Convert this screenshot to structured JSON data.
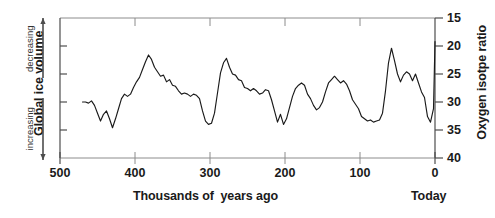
{
  "figure": {
    "left_axis": {
      "title": "Global ice volume",
      "direction_top": "decreasing",
      "direction_bottom": "increasing"
    },
    "right_axis": {
      "title": "Oxygen isotpe ratio",
      "tick_labels": [
        "15",
        "20",
        "25",
        "30",
        "35",
        "40"
      ]
    },
    "x_axis": {
      "title": "Thousands of  years ago",
      "end_label": "Today",
      "tick_labels": [
        "500",
        "400",
        "300",
        "200",
        "100",
        "0"
      ]
    },
    "colors": {
      "line": "#1a1a1a",
      "axis": "#4d4d4d",
      "text": "#1a1a1a",
      "background": "#ffffff"
    }
  },
  "chart_data": {
    "type": "line",
    "title": "",
    "subtitle": "",
    "xlabel": "Thousands of  years ago",
    "ylabel": "Oxygen isotpe ratio",
    "ylabel_left": "Global ice volume",
    "grid": false,
    "legend": null,
    "xlim": [
      500,
      0
    ],
    "ylim": [
      40,
      15
    ],
    "y_axis_inverted": true,
    "x_axis_reversed": true,
    "xticks": [
      500,
      400,
      300,
      200,
      100,
      0
    ],
    "yticks": [
      15,
      20,
      25,
      30,
      35,
      40
    ],
    "series": [
      {
        "name": "Oxygen isotope ratio",
        "x": [
          470,
          466,
          462,
          458,
          454,
          450,
          446,
          442,
          438,
          434,
          430,
          426,
          422,
          418,
          414,
          410,
          406,
          402,
          398,
          394,
          390,
          386,
          382,
          378,
          374,
          370,
          366,
          362,
          358,
          354,
          350,
          346,
          342,
          338,
          334,
          330,
          326,
          322,
          318,
          314,
          310,
          306,
          302,
          298,
          294,
          290,
          286,
          282,
          278,
          274,
          270,
          266,
          262,
          258,
          254,
          250,
          246,
          242,
          238,
          234,
          230,
          226,
          222,
          218,
          214,
          210,
          206,
          202,
          198,
          194,
          190,
          186,
          182,
          178,
          174,
          170,
          166,
          162,
          158,
          154,
          150,
          146,
          142,
          138,
          134,
          130,
          126,
          122,
          118,
          114,
          110,
          106,
          102,
          98,
          94,
          90,
          86,
          82,
          78,
          74,
          70,
          66,
          62,
          58,
          54,
          50,
          46,
          42,
          38,
          34,
          30,
          26,
          22,
          18,
          14,
          10,
          6,
          2,
          0
        ],
        "y": [
          30.0,
          30.0,
          30.2,
          29.8,
          30.6,
          32.0,
          33.4,
          32.2,
          31.6,
          33.0,
          34.6,
          33.0,
          31.2,
          29.4,
          28.6,
          29.0,
          28.6,
          27.4,
          26.4,
          25.6,
          24.2,
          22.8,
          21.6,
          22.4,
          23.8,
          24.6,
          25.4,
          25.2,
          26.4,
          26.0,
          27.0,
          27.2,
          28.0,
          28.6,
          28.4,
          28.6,
          29.0,
          28.6,
          28.8,
          29.4,
          31.6,
          33.4,
          34.0,
          33.8,
          32.0,
          28.4,
          24.8,
          23.0,
          22.2,
          23.8,
          25.0,
          25.2,
          26.0,
          26.2,
          27.4,
          27.6,
          28.0,
          27.6,
          28.0,
          28.6,
          28.4,
          27.8,
          28.0,
          29.6,
          31.6,
          33.6,
          32.2,
          34.0,
          33.0,
          31.0,
          29.0,
          27.6,
          27.0,
          26.6,
          27.0,
          28.6,
          29.4,
          30.6,
          31.4,
          31.0,
          30.0,
          28.2,
          26.6,
          26.0,
          25.4,
          26.0,
          26.6,
          26.2,
          26.8,
          28.0,
          29.6,
          30.4,
          31.2,
          32.6,
          33.0,
          33.4,
          33.2,
          33.6,
          33.4,
          33.2,
          32.0,
          28.0,
          23.0,
          20.4,
          22.6,
          25.0,
          26.4,
          25.2,
          24.6,
          25.0,
          26.2,
          25.0,
          26.6,
          28.2,
          29.2,
          32.6,
          33.6,
          31.2,
          19.2
        ]
      }
    ]
  }
}
